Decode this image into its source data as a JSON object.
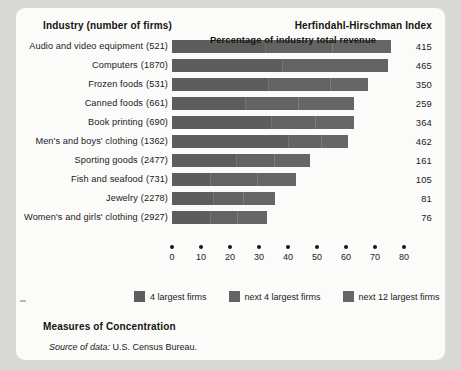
{
  "header": {
    "industry_label": "Industry (number of firms)",
    "hhi_label": "Herfindahl-Hirschman Index"
  },
  "footer": {
    "title": "Measures of Concentration",
    "source_prefix": "Source of data:",
    "source_value": "U.S. Census Bureau."
  },
  "legend": {
    "items": [
      {
        "label": "4 largest firms",
        "color": "#5d5d5d"
      },
      {
        "label": "next 4 largest firms",
        "color": "#636363"
      },
      {
        "label": "next 12 largest firms",
        "color": "#666666"
      }
    ]
  },
  "chart_data": {
    "type": "bar",
    "orientation": "horizontal",
    "stacked": true,
    "title": "Measures of Concentration",
    "xlabel": "Percentage of industry total revenue",
    "ylabel": "Industry (number of firms)",
    "xlim": [
      0,
      80
    ],
    "xticks": [
      0,
      10,
      20,
      30,
      40,
      50,
      60,
      70,
      80
    ],
    "grid": false,
    "legend_position": "bottom",
    "categories": [
      "Audio and video equipment",
      "Computers",
      "Frozen foods",
      "Canned foods",
      "Book printing",
      "Men's and boys' clothing",
      "Sporting goods",
      "Fish and seafood",
      "Jewelry",
      "Women's and girls' clothing"
    ],
    "firm_counts": [
      521,
      1870,
      531,
      661,
      690,
      1362,
      2477,
      731,
      2278,
      2927
    ],
    "series": [
      {
        "name": "4 largest firms",
        "values": [
          32,
          38,
          33,
          25,
          34,
          40,
          22,
          13,
          14,
          13
        ]
      },
      {
        "name": "next 4 largest firms",
        "values": [
          23,
          36,
          21,
          18,
          15,
          11,
          13,
          16,
          10,
          9
        ]
      },
      {
        "name": "next 12 largest firms",
        "values": [
          20,
          0,
          13,
          19,
          13,
          9,
          12,
          13,
          11,
          10
        ]
      }
    ],
    "hhi_values": [
      415,
      465,
      350,
      259,
      364,
      462,
      161,
      105,
      81,
      76
    ],
    "hhi_axis_label": "Herfindahl-Hirschman Index"
  }
}
